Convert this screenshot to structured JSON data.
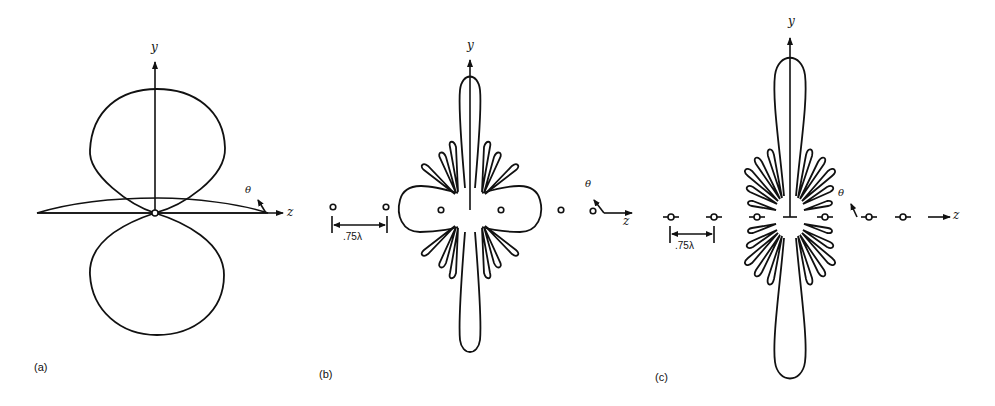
{
  "figure": {
    "panels": [
      {
        "id": "a",
        "label": "(a)",
        "y_axis": "y",
        "z_axis": "z",
        "theta": "θ",
        "description": "Single element dipole-like pattern: two circular lobes along y plus a flat lobe along z"
      },
      {
        "id": "b",
        "label": "(b)",
        "y_axis": "y",
        "z_axis": "z",
        "theta": "θ",
        "spacing": ".75λ",
        "elements": 6,
        "description": "Array pattern with narrow main beam along y, side lobes and broad endfire lobes"
      },
      {
        "id": "c",
        "label": "(c)",
        "y_axis": "y",
        "z_axis": "z",
        "theta": "θ",
        "spacing": ".75λ",
        "elements": 7,
        "description": "Larger array pattern with narrow main beam along y and many narrow side lobes"
      }
    ]
  },
  "colors": {
    "stroke": "#111111",
    "background": "#ffffff"
  }
}
